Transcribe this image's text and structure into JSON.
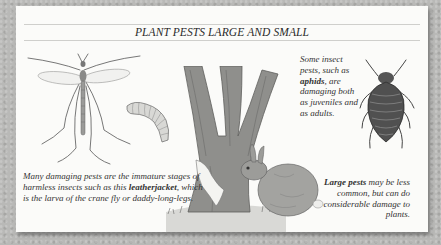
{
  "panel": {
    "title": "PLANT PESTS LARGE AND SMALL",
    "colors": {
      "background": "#b9b9b7",
      "panel": "#fbfbf9",
      "rule": "#cfcfcc",
      "text": "#333333"
    }
  },
  "captions": {
    "leatherjacket": {
      "before": "Many damaging pests are the immature stages of harmless insects such as this ",
      "bold": "leatherjacket",
      "after": ", which is the larva of the crane fly or daddy-long-legs."
    },
    "aphids": {
      "before": "Some insect pests, such as ",
      "bold": "aphids",
      "after": ", are damaging both as juveniles and as adults."
    },
    "large_pests": {
      "bold": "Large pests",
      "after": " may be less common, but can do considerable damage to plants."
    }
  },
  "illustrations": [
    {
      "name": "crane-fly",
      "label": "crane fly (daddy-long-legs)"
    },
    {
      "name": "leatherjacket-larva",
      "label": "leatherjacket larva"
    },
    {
      "name": "tree-trunk",
      "label": "tree with stripped bark"
    },
    {
      "name": "rabbit",
      "label": "rabbit"
    },
    {
      "name": "aphid",
      "label": "aphid"
    }
  ]
}
